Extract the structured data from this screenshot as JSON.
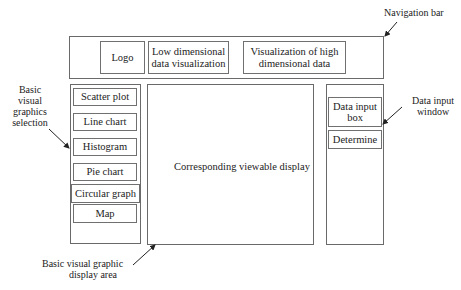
{
  "navigation_bar": {
    "logo_label": "Logo",
    "low_dim_label_line1": "Low dimensional",
    "low_dim_label_line2": "data visualization",
    "high_dim_label_line1": "Visualization of high",
    "high_dim_label_line2": "dimensional data"
  },
  "sidebar": {
    "items": [
      {
        "label": "Scatter plot"
      },
      {
        "label": "Line chart"
      },
      {
        "label": "Histogram"
      },
      {
        "label": "Pie chart"
      },
      {
        "label": "Circular graph"
      },
      {
        "label": "Map"
      }
    ]
  },
  "main_display": {
    "label": "Corresponding viewable display"
  },
  "data_panel": {
    "input_box_line1": "Data input",
    "input_box_line2": "box",
    "determine_label": "Determine"
  },
  "annotations": {
    "navigation_bar": "Navigation bar",
    "selection_line1": "Basic",
    "selection_line2": "visual",
    "selection_line3": "graphics",
    "selection_line4": "selection",
    "display_area_line1": "Basic visual graphic",
    "display_area_line2": "display area",
    "data_input_window_line1": "Data input",
    "data_input_window_line2": "window"
  },
  "colors": {
    "border": "#6a6a6a",
    "text": "#222222",
    "background": "#ffffff"
  }
}
